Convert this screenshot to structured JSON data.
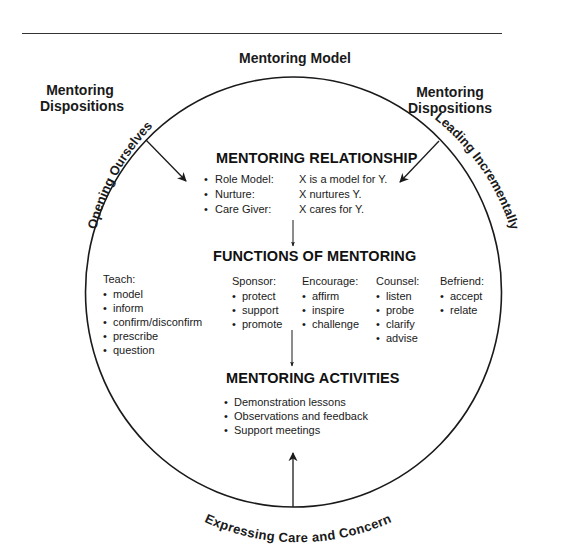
{
  "diagram": {
    "title": "Mentoring Model",
    "dispositions_left": "Mentoring Dispositions",
    "dispositions_right": "Mentoring Dispositions",
    "arc_labels": {
      "top_left": "Opening Ourselves",
      "top_right": "Leading Incrementally",
      "bottom": "Expressing Care and Concern"
    },
    "relationship": {
      "heading": "MENTORING RELATIONSHIP",
      "rows": [
        {
          "bullet": "•",
          "term": "Role Model:",
          "desc": "X is a model for Y."
        },
        {
          "bullet": "•",
          "term": "Nurture:",
          "desc": "X nurtures Y."
        },
        {
          "bullet": "•",
          "term": "Care Giver:",
          "desc": "X cares for Y."
        }
      ]
    },
    "functions": {
      "heading": "FUNCTIONS OF MENTORING",
      "columns": [
        {
          "head": "Teach:",
          "items": [
            "model",
            "inform",
            "confirm/disconfirm",
            "prescribe",
            "question"
          ]
        },
        {
          "head": "Sponsor:",
          "items": [
            "protect",
            "support",
            "promote"
          ]
        },
        {
          "head": "Encourage:",
          "items": [
            "affirm",
            "inspire",
            "challenge"
          ]
        },
        {
          "head": "Counsel:",
          "items": [
            "listen",
            "probe",
            "clarify",
            "advise"
          ]
        },
        {
          "head": "Befriend:",
          "items": [
            "accept",
            "relate"
          ]
        }
      ]
    },
    "activities": {
      "heading": "MENTORING ACTIVITIES",
      "items": [
        "Demonstration lessons",
        "Observations and feedback",
        "Support meetings"
      ]
    }
  }
}
